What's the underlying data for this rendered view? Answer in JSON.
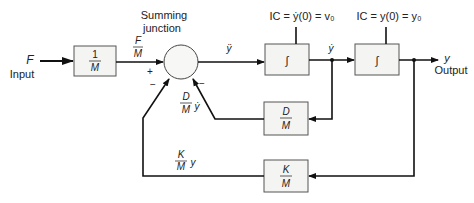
{
  "diagram": {
    "type": "block-diagram",
    "title": "",
    "input": {
      "symbol": "F",
      "label": "Input"
    },
    "output": {
      "symbol": "y",
      "label": "Output"
    },
    "blocks": [
      {
        "id": "gain-1-over-M",
        "numerator": "1",
        "denominator": "M"
      },
      {
        "id": "integrator-1",
        "symbol": "∫",
        "ic_label": "IC = ẏ(0) = v₀"
      },
      {
        "id": "integrator-2",
        "symbol": "∫",
        "ic_label": "IC = y(0) = y₀"
      },
      {
        "id": "gain-D-over-M",
        "numerator": "D",
        "denominator": "M"
      },
      {
        "id": "gain-K-over-M",
        "numerator": "K",
        "denominator": "M"
      }
    ],
    "summing_junction": {
      "label_line1": "Summing",
      "label_line2": "junction",
      "sign_plus": "+",
      "sign_minus_left": "−",
      "sign_minus_right": "−"
    },
    "signals": {
      "f_over_m": {
        "numerator": "F",
        "denominator": "M"
      },
      "y_ddot": "ÿ",
      "y_dot": "ẏ",
      "d_feedback": {
        "numerator": "D",
        "denominator": "M",
        "suffix": "ẏ"
      },
      "k_feedback": {
        "numerator": "K",
        "denominator": "M",
        "suffix": "y"
      }
    }
  }
}
